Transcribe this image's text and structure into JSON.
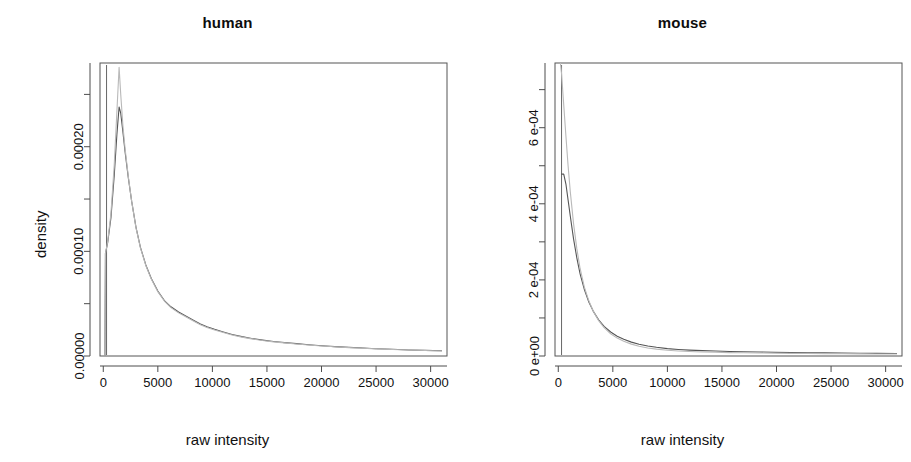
{
  "figure": {
    "panel_count": 2,
    "background": "#ffffff",
    "line_color_dark": "#555555",
    "line_color_light": "#b9b9b9"
  },
  "chart_data": [
    {
      "type": "line",
      "title": "human",
      "xlabel": "raw intensity",
      "ylabel": "density",
      "xlim": [
        -300,
        31500
      ],
      "ylim": [
        0,
        0.00028
      ],
      "grid": false,
      "legend": "none",
      "xticks": [
        0,
        5000,
        10000,
        15000,
        20000,
        25000,
        30000
      ],
      "xticklabels": [
        "0",
        "5000",
        "10000",
        "15000",
        "20000",
        "25000",
        "30000"
      ],
      "yticks": [
        0.0,
        0.0001,
        0.0002
      ],
      "yticklabels": [
        "0.00000",
        "0.00010",
        "0.00020"
      ],
      "yminorticks": [
        5e-05,
        0.00015,
        0.00025
      ],
      "series": [
        {
          "name": "human-density-dark",
          "color": "#555555",
          "x": [
            150,
            200,
            400,
            700,
            1000,
            1250,
            1450,
            1600,
            1800,
            2000,
            2300,
            2600,
            3000,
            3400,
            3900,
            4400,
            5000,
            5600,
            6200,
            6900,
            7600,
            8300,
            8900,
            9500,
            10200,
            11000,
            11800,
            12700,
            13600,
            14600,
            15600,
            16600,
            17700,
            18800,
            20000,
            21200,
            22500,
            23800,
            25000,
            26500,
            28000,
            29500,
            31000
          ],
          "y": [
            0.0,
            9.8e-05,
            0.000108,
            0.000132,
            0.000172,
            0.000212,
            0.000238,
            0.000232,
            0.000214,
            0.000195,
            0.00017,
            0.000148,
            0.000123,
            0.000104,
            8.7e-05,
            7.4e-05,
            6.2e-05,
            5.3e-05,
            4.7e-05,
            4.2e-05,
            3.8e-05,
            3.4e-05,
            3.05e-05,
            2.8e-05,
            2.55e-05,
            2.3e-05,
            2.05e-05,
            1.85e-05,
            1.68e-05,
            1.52e-05,
            1.38e-05,
            1.28e-05,
            1.18e-05,
            1.08e-05,
            9.8e-06,
            9e-06,
            8.2e-06,
            7.6e-06,
            7e-06,
            6.4e-06,
            5.8e-06,
            5.4e-06,
            5e-06
          ]
        },
        {
          "name": "human-density-light",
          "color": "#b9b9b9",
          "x": [
            150,
            200,
            400,
            700,
            1000,
            1250,
            1450,
            1600,
            1800,
            2000,
            2300,
            2600,
            3000,
            3400,
            3900,
            4400,
            5000,
            5600,
            6200,
            6900,
            7600,
            8300,
            8900,
            9500,
            10200,
            11000,
            11800,
            12700,
            13600,
            14600,
            15600,
            16600,
            17700,
            18800,
            20000,
            21200,
            22500,
            23800,
            25000,
            26500,
            28000,
            29500,
            31000
          ],
          "y": [
            0.0,
            9.8e-05,
            0.000109,
            0.000136,
            0.000182,
            0.000234,
            0.000276,
            0.00025,
            0.00022,
            0.000198,
            0.000171,
            0.000148,
            0.0001225,
            0.0001035,
            8.65e-05,
            7.35e-05,
            6.15e-05,
            5.25e-05,
            4.62e-05,
            4.12e-05,
            3.72e-05,
            3.32e-05,
            2.98e-05,
            2.72e-05,
            2.48e-05,
            2.24e-05,
            2e-05,
            1.8e-05,
            1.64e-05,
            1.48e-05,
            1.35e-05,
            1.25e-05,
            1.15e-05,
            1.05e-05,
            9.6e-06,
            8.8e-06,
            8e-06,
            7.4e-06,
            6.8e-06,
            6.2e-06,
            5.7e-06,
            5.2e-06,
            4.8e-06
          ]
        }
      ],
      "vertical_rule_x": 300
    },
    {
      "type": "line",
      "title": "mouse",
      "xlabel": "raw intensity",
      "ylabel": "density",
      "xlim": [
        -300,
        31500
      ],
      "ylim": [
        0,
        0.00077
      ],
      "grid": false,
      "legend": "none",
      "xticks": [
        0,
        5000,
        10000,
        15000,
        20000,
        25000,
        30000
      ],
      "xticklabels": [
        "0",
        "5000",
        "10000",
        "15000",
        "20000",
        "25000",
        "30000"
      ],
      "yticks": [
        0.0,
        0.0002,
        0.0004,
        0.0006
      ],
      "yticklabels": [
        "0 e+00",
        "2 e-04",
        "4 e-04",
        "6 e-04"
      ],
      "yminorticks": [
        0.0001,
        0.0003,
        0.0005,
        0.0007
      ],
      "series": [
        {
          "name": "mouse-density-dark",
          "color": "#555555",
          "x": [
            300,
            500,
            700,
            900,
            1100,
            1400,
            1700,
            2000,
            2400,
            2800,
            3200,
            3700,
            4200,
            4800,
            5400,
            6000,
            6700,
            7400,
            8200,
            9000,
            10000,
            11000,
            12000,
            13200,
            14400,
            15700,
            17000,
            18400,
            19800,
            21300,
            22800,
            24400,
            26000,
            27600,
            29200,
            31000
          ],
          "y": [
            0.000478,
            0.000478,
            0.000452,
            0.00041,
            0.000368,
            0.000308,
            0.000258,
            0.000216,
            0.000174,
            0.000142,
            0.000118,
            9.5e-05,
            7.8e-05,
            6.3e-05,
            5.2e-05,
            4.4e-05,
            3.65e-05,
            3.1e-05,
            2.62e-05,
            2.28e-05,
            1.95e-05,
            1.72e-05,
            1.55e-05,
            1.4e-05,
            1.3e-05,
            1.2e-05,
            1.12e-05,
            1.05e-05,
            9.8e-06,
            9.2e-06,
            8.7e-06,
            8.2e-06,
            7.7e-06,
            7.3e-06,
            6.9e-06,
            6.5e-06
          ]
        },
        {
          "name": "mouse-density-light",
          "color": "#b9b9b9",
          "x": [
            150,
            300,
            500,
            700,
            900,
            1100,
            1400,
            1700,
            2000,
            2400,
            2800,
            3200,
            3700,
            4200,
            4800,
            5400,
            6000,
            6700,
            7400,
            8200,
            9000,
            10000,
            11000,
            12000,
            13200,
            14400,
            15700,
            17000,
            18400,
            19800,
            21300,
            22800,
            24400,
            26000,
            27600,
            29200,
            31000
          ],
          "y": [
            0.00079,
            0.000742,
            0.00066,
            0.000578,
            0.0005,
            0.000432,
            0.000348,
            0.000282,
            0.00023,
            0.00018,
            0.000145,
            0.000118,
            9.3e-05,
            7.45e-05,
            5.85e-05,
            4.7e-05,
            3.88e-05,
            3.12e-05,
            2.58e-05,
            2.12e-05,
            1.8e-05,
            1.5e-05,
            1.32e-05,
            1.18e-05,
            1.06e-05,
            9.8e-06,
            9e-06,
            8.4e-06,
            7.9e-06,
            7.4e-06,
            7e-06,
            6.6e-06,
            6.3e-06,
            6e-06,
            5.7e-06,
            5.4e-06,
            5.1e-06
          ]
        }
      ],
      "vertical_rule_x": 300
    }
  ]
}
